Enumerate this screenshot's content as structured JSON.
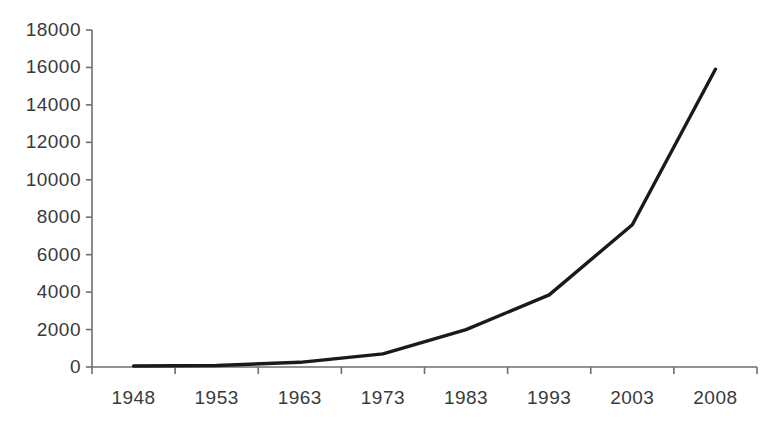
{
  "chart_data": {
    "type": "line",
    "title": "",
    "subtitle": "",
    "xlabel": "",
    "ylabel": "",
    "categories": [
      "1948",
      "1953",
      "1963",
      "1973",
      "1983",
      "1993",
      "2003",
      "2008"
    ],
    "values": [
      50,
      80,
      250,
      700,
      2000,
      3850,
      7600,
      15900
    ],
    "series": [
      {
        "name": "",
        "values": [
          50,
          80,
          250,
          700,
          2000,
          3850,
          7600,
          15900
        ]
      }
    ],
    "ylim": [
      0,
      18000
    ],
    "ytick_labels": [
      "18000",
      "16000",
      "14000",
      "12000",
      "10000",
      "8000",
      "6000",
      "4000",
      "2000",
      "0"
    ],
    "ytick_values": [
      18000,
      16000,
      14000,
      12000,
      10000,
      8000,
      6000,
      4000,
      2000,
      0
    ],
    "grid": false,
    "legend": false,
    "legend_position": "none",
    "annotations": [],
    "line_color": "#1a1a1a",
    "axis_color": "#6e6e6e",
    "text_color": "#3a3a3a",
    "background_color": "#ffffff"
  }
}
